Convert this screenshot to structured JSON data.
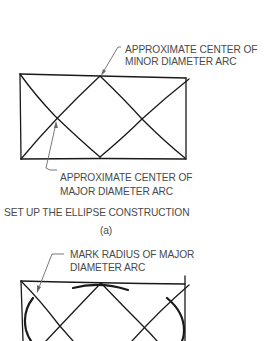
{
  "figure_a": {
    "minor_label_line1": "APPROXIMATE CENTER OF",
    "minor_label_line2": "MINOR DIAMETER ARC",
    "major_label_line1": "APPROXIMATE CENTER OF",
    "major_label_line2": "MAJOR DIAMETER ARC",
    "caption": "SET UP THE ELLIPSE CONSTRUCTION",
    "sub_caption": "(a)"
  },
  "figure_b": {
    "label_line1": "MARK RADIUS OF MAJOR",
    "label_line2": "DIAMETER ARC"
  },
  "colors": {
    "line": "#1a1a1a",
    "leader": "#6a6a6a",
    "text": "#4a4a4a"
  }
}
